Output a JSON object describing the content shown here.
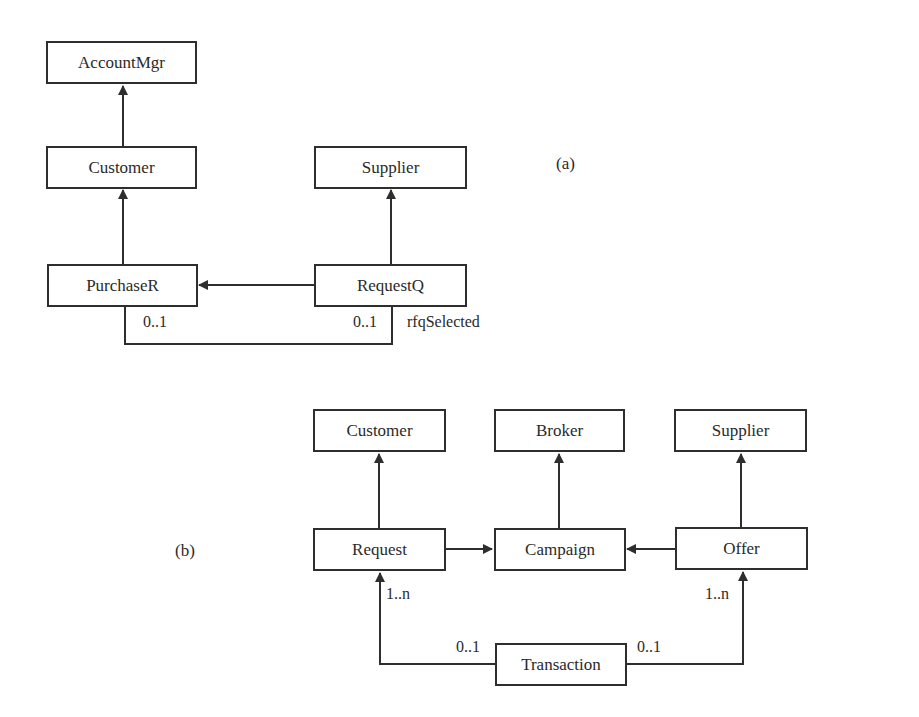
{
  "diagram_a": {
    "label": "(a)",
    "boxes": {
      "account_mgr": "AccountMgr",
      "customer": "Customer",
      "supplier": "Supplier",
      "purchase_r": "PurchaseR",
      "request_q": "RequestQ"
    },
    "association": {
      "multiplicity_left": "0..1",
      "multiplicity_right": "0..1",
      "role": "rfqSelected"
    }
  },
  "diagram_b": {
    "label": "(b)",
    "boxes": {
      "customer": "Customer",
      "broker": "Broker",
      "supplier": "Supplier",
      "request": "Request",
      "campaign": "Campaign",
      "offer": "Offer",
      "transaction": "Transaction"
    },
    "multiplicities": {
      "request_end": "1..n",
      "offer_end": "1..n",
      "transaction_left": "0..1",
      "transaction_right": "0..1"
    }
  },
  "colors": {
    "line": "#2e2e2e",
    "background": "#ffffff"
  }
}
